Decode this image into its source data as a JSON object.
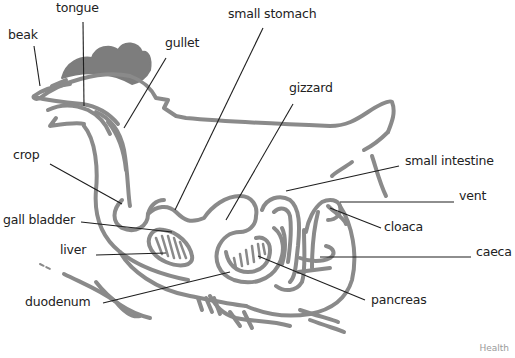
{
  "diagram": {
    "colors": {
      "outline": "#8a8a8a",
      "comb": "#7d7d7d",
      "leader": "#1e1e1e",
      "text": "#222222"
    },
    "labels": [
      {
        "id": "beak",
        "text": "beak"
      },
      {
        "id": "tongue",
        "text": "tongue"
      },
      {
        "id": "gullet",
        "text": "gullet"
      },
      {
        "id": "small-stomach",
        "text": "small stomach"
      },
      {
        "id": "gizzard",
        "text": "gizzard"
      },
      {
        "id": "crop",
        "text": "crop"
      },
      {
        "id": "small-intestine",
        "text": "small intestine"
      },
      {
        "id": "vent",
        "text": "vent"
      },
      {
        "id": "gall-bladder",
        "text": "gall bladder"
      },
      {
        "id": "cloaca",
        "text": "cloaca"
      },
      {
        "id": "liver",
        "text": "liver"
      },
      {
        "id": "caeca",
        "text": "caeca"
      },
      {
        "id": "duodenum",
        "text": "duodenum"
      },
      {
        "id": "pancreas",
        "text": "pancreas"
      }
    ],
    "credit": "Health"
  }
}
